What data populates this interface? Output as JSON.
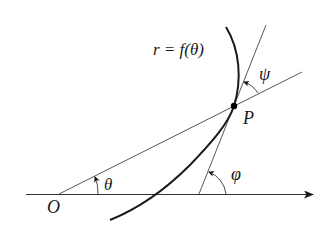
{
  "diagram": {
    "type": "polar-curve-tangent-angles",
    "labels": {
      "curve_equation": "r = f(θ)",
      "point": "P",
      "origin": "O",
      "theta": "θ",
      "phi": "φ",
      "psi": "ψ"
    },
    "elements": {
      "polar_axis": "horizontal ray from O to the right with arrowhead",
      "radius_line": "line from O through P",
      "tangent_line": "tangent to curve at P, crossing the polar axis",
      "curve": "r = f(θ) passing through P",
      "angles": [
        {
          "name": "θ",
          "between": "polar axis and line OP",
          "at": "O"
        },
        {
          "name": "φ",
          "between": "polar axis and tangent line",
          "at": "tangent-axis intersection"
        },
        {
          "name": "ψ",
          "between": "line OP and tangent line",
          "at": "P"
        }
      ]
    },
    "colors": {
      "ink": "#1a1a1a",
      "thin_line": "#444444",
      "background": "#ffffff"
    }
  }
}
